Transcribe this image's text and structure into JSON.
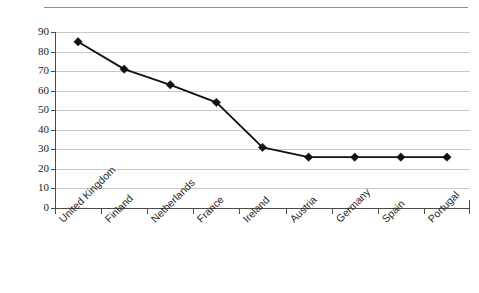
{
  "chart_data": {
    "type": "line",
    "title": "",
    "xlabel": "",
    "ylabel": "",
    "categories": [
      "United Kingdom",
      "Finland",
      "Netherlands",
      "France",
      "Ireland",
      "Austria",
      "Germany",
      "Spain",
      "Portugal"
    ],
    "values": [
      85,
      71,
      63,
      54,
      31,
      26,
      26,
      26,
      26
    ],
    "series": [
      {
        "name": "",
        "values": [
          85,
          71,
          63,
          54,
          31,
          26,
          26,
          26,
          26
        ]
      }
    ],
    "ylim": [
      0,
      90
    ],
    "yticks": [
      0,
      10,
      20,
      30,
      40,
      50,
      60,
      70,
      80,
      90
    ],
    "ytick_labels": [
      "0",
      "10",
      "20",
      "30",
      "40",
      "50",
      "60",
      "70",
      "80",
      "90"
    ],
    "grid": true,
    "legend": "none",
    "marker": "diamond",
    "line_color": "#111111",
    "grid_color": "#c8c8c8",
    "axis_color": "#4a4a4a"
  },
  "yaxis": {
    "labels": [
      "90",
      "80",
      "70",
      "60",
      "50",
      "40",
      "30",
      "20",
      "10",
      "0"
    ]
  },
  "xaxis": {
    "labels": [
      "United Kingdom",
      "Finland",
      "Netherlands",
      "France",
      "Ireland",
      "Austria",
      "Germany",
      "Spain",
      "Portugal"
    ]
  },
  "header": {
    "title_remnant": ""
  }
}
